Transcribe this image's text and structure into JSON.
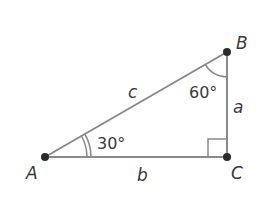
{
  "diagram": {
    "type": "right-triangle",
    "colors": {
      "stroke": "#8a8a8a",
      "vertex": "#2b2b2b",
      "text": "#3a3a3a"
    },
    "vertices": {
      "A": {
        "label": "A",
        "x": 45,
        "y": 157
      },
      "B": {
        "label": "B",
        "x": 227,
        "y": 52
      },
      "C": {
        "label": "C",
        "x": 227,
        "y": 157
      }
    },
    "sides": {
      "a": {
        "label": "a"
      },
      "b": {
        "label": "b"
      },
      "c": {
        "label": "c"
      }
    },
    "angles": {
      "A": {
        "label": "30°"
      },
      "B": {
        "label": "60°"
      },
      "C": {
        "label": "right-angle"
      }
    }
  }
}
